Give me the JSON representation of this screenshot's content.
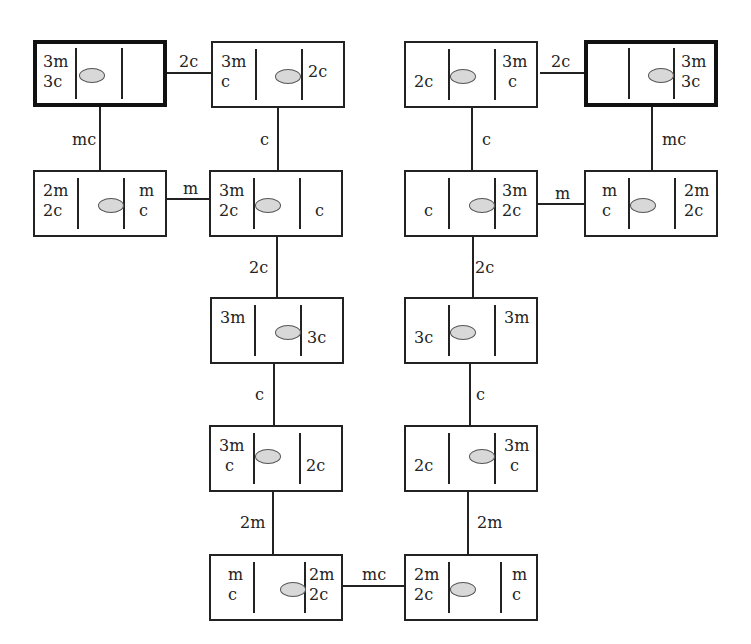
{
  "diagram": {
    "type": "state-space graph",
    "states": [
      {
        "id": "s1",
        "left": [
          "3m",
          "3c"
        ],
        "right": [],
        "boat": "left",
        "terminal": true
      },
      {
        "id": "s2",
        "left": [
          "3m",
          "c"
        ],
        "right": [
          "2c"
        ],
        "boat": "right",
        "terminal": false
      },
      {
        "id": "s3",
        "left": [
          "2m",
          "2c"
        ],
        "right": [
          "m",
          "c"
        ],
        "boat": "right",
        "terminal": false
      },
      {
        "id": "s4",
        "left": [
          "3m",
          "2c"
        ],
        "right": [
          "c"
        ],
        "boat": "left",
        "terminal": false
      },
      {
        "id": "s5",
        "left": [
          "3m"
        ],
        "right": [
          "3c"
        ],
        "boat": "right",
        "terminal": false
      },
      {
        "id": "s6",
        "left": [
          "3m",
          "c"
        ],
        "right": [
          "2c"
        ],
        "boat": "left",
        "terminal": false
      },
      {
        "id": "s7",
        "left": [
          "m",
          "c"
        ],
        "right": [
          "2m",
          "2c"
        ],
        "boat": "right",
        "terminal": false
      },
      {
        "id": "s8",
        "left": [
          "2m",
          "2c"
        ],
        "right": [
          "m",
          "c"
        ],
        "boat": "left",
        "terminal": false
      },
      {
        "id": "s9",
        "left": [
          "2c"
        ],
        "right": [
          "3m",
          "c"
        ],
        "boat": "right",
        "terminal": false
      },
      {
        "id": "s10",
        "left": [
          "3c"
        ],
        "right": [
          "3m"
        ],
        "boat": "left",
        "terminal": false
      },
      {
        "id": "s11",
        "left": [
          "c"
        ],
        "right": [
          "3m",
          "2c"
        ],
        "boat": "right",
        "terminal": false
      },
      {
        "id": "s12",
        "left": [
          "m",
          "c"
        ],
        "right": [
          "2m",
          "2c"
        ],
        "boat": "left",
        "terminal": false
      },
      {
        "id": "s13",
        "left": [
          "2c"
        ],
        "right": [
          "3m",
          "c"
        ],
        "boat": "left",
        "terminal": false
      },
      {
        "id": "s14",
        "left": [],
        "right": [
          "3m",
          "3c"
        ],
        "boat": "right",
        "terminal": true
      }
    ],
    "edges": [
      {
        "from": "s1",
        "to": "s2",
        "label": "2c"
      },
      {
        "from": "s1",
        "to": "s3",
        "label": "mc"
      },
      {
        "from": "s2",
        "to": "s4",
        "label": "c"
      },
      {
        "from": "s3",
        "to": "s4",
        "label": "m"
      },
      {
        "from": "s4",
        "to": "s5",
        "label": "2c"
      },
      {
        "from": "s5",
        "to": "s6",
        "label": "c"
      },
      {
        "from": "s6",
        "to": "s7",
        "label": "2m"
      },
      {
        "from": "s7",
        "to": "s8",
        "label": "mc"
      },
      {
        "from": "s8",
        "to": "s9",
        "label": "2m"
      },
      {
        "from": "s9",
        "to": "s10",
        "label": "c"
      },
      {
        "from": "s10",
        "to": "s11",
        "label": "2c"
      },
      {
        "from": "s11",
        "to": "s12",
        "label": "m"
      },
      {
        "from": "s11",
        "to": "s13",
        "label": "c"
      },
      {
        "from": "s13",
        "to": "s14",
        "label": "2c"
      },
      {
        "from": "s12",
        "to": "s14",
        "label": "mc"
      }
    ]
  },
  "labels": {
    "s1": {
      "l1": "3m",
      "l2": "3c",
      "r1": "",
      "r2": ""
    },
    "s2": {
      "l1": "3m",
      "l2": "c",
      "r1": "",
      "r2": "2c"
    },
    "s3": {
      "l1": "2m",
      "l2": "2c",
      "r1": "m",
      "r2": "c"
    },
    "s4": {
      "l1": "3m",
      "l2": "2c",
      "r1": "",
      "r2": "c"
    },
    "s5": {
      "l1": "3m",
      "l2": "",
      "r1": "",
      "r2": "3c"
    },
    "s6": {
      "l1": "3m",
      "l2": "c",
      "r1": "",
      "r2": "2c"
    },
    "s7": {
      "l1": "m",
      "l2": "c",
      "r1": "2m",
      "r2": "2c"
    },
    "s8": {
      "l1": "2m",
      "l2": "2c",
      "r1": "m",
      "r2": "c"
    },
    "s9": {
      "l1": "",
      "l2": "2c",
      "r1": "3m",
      "r2": "c"
    },
    "s10": {
      "l1": "",
      "l2": "3c",
      "r1": "3m",
      "r2": ""
    },
    "s11": {
      "l1": "",
      "l2": "c",
      "r1": "3m",
      "r2": "2c"
    },
    "s12": {
      "l1": "m",
      "l2": "c",
      "r1": "2m",
      "r2": "2c"
    },
    "s13": {
      "l1": "",
      "l2": "2c",
      "r1": "3m",
      "r2": "c"
    },
    "s14": {
      "l1": "",
      "l2": "",
      "r1": "3m",
      "r2": "3c"
    }
  },
  "edge_labels": {
    "e1": "2c",
    "e2": "mc",
    "e3": "c",
    "e4": "m",
    "e5": "2c",
    "e6": "c",
    "e7": "2m",
    "e8": "mc",
    "e9": "2m",
    "e10": "c",
    "e11": "2c",
    "e12": "m",
    "e13": "c",
    "e14": "2c",
    "e15": "mc"
  }
}
